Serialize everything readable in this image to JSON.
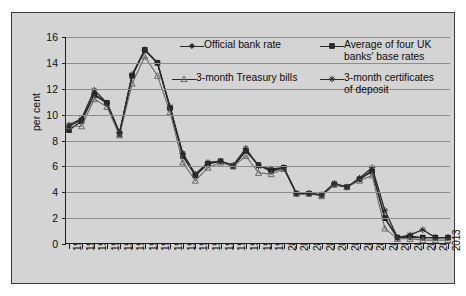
{
  "chart_data": {
    "type": "line",
    "title": "",
    "xlabel": "",
    "ylabel": "per cent",
    "ylim": [
      0,
      16
    ],
    "yticks": [
      0,
      2,
      4,
      6,
      8,
      10,
      12,
      14,
      16
    ],
    "grid": true,
    "legend_position": "top-right-inside",
    "categories": [
      "1983",
      "1984",
      "1985",
      "1986",
      "1987",
      "1988",
      "1989",
      "1990",
      "1991",
      "1992",
      "1993",
      "1994",
      "1995",
      "1996",
      "1997",
      "1998",
      "1999",
      "2000",
      "2001",
      "2002",
      "2003",
      "2004",
      "2005",
      "2006",
      "2007",
      "2008",
      "2009",
      "2010",
      "2011",
      "2012",
      "2013"
    ],
    "series": [
      {
        "name": "Official bank rate",
        "marker": "diamond",
        "color": "#2b2b2b",
        "values": [
          9.1,
          9.6,
          11.6,
          10.9,
          8.6,
          13.0,
          15.0,
          14.0,
          10.5,
          7.0,
          5.3,
          6.2,
          6.4,
          6.0,
          7.2,
          6.1,
          5.6,
          5.9,
          3.9,
          3.9,
          3.8,
          4.6,
          4.4,
          5.0,
          5.7,
          2.0,
          0.5,
          0.5,
          0.5,
          0.5,
          0.5
        ]
      },
      {
        "name": "Average of four UK banks' base rates",
        "marker": "square",
        "color": "#2b2b2b",
        "values": [
          8.8,
          9.5,
          11.5,
          10.9,
          8.5,
          13.0,
          15.0,
          14.0,
          10.5,
          6.8,
          5.3,
          6.2,
          6.4,
          6.0,
          7.2,
          6.1,
          5.7,
          5.9,
          3.9,
          3.9,
          3.8,
          4.6,
          4.4,
          5.0,
          5.6,
          2.0,
          0.5,
          0.6,
          0.5,
          0.5,
          0.5
        ]
      },
      {
        "name": "3-month Treasury bills",
        "marker": "triangle",
        "color": "#6a6a6a",
        "values": [
          9.1,
          9.1,
          11.2,
          10.6,
          8.4,
          12.4,
          14.5,
          13.0,
          10.2,
          6.3,
          4.9,
          5.9,
          6.3,
          6.0,
          6.8,
          5.5,
          5.4,
          5.8,
          3.9,
          3.9,
          3.7,
          4.6,
          4.4,
          4.9,
          5.3,
          1.2,
          0.4,
          0.4,
          0.3,
          0.3,
          0.3
        ]
      },
      {
        "name": "3-month certificates of deposit",
        "marker": "star",
        "color": "#2b2b2b",
        "values": [
          9.2,
          9.7,
          11.9,
          10.9,
          8.6,
          13.1,
          15.0,
          14.0,
          10.6,
          7.0,
          5.4,
          6.3,
          6.4,
          6.1,
          7.4,
          6.0,
          5.8,
          5.9,
          3.9,
          3.9,
          3.8,
          4.7,
          4.4,
          5.1,
          5.9,
          2.6,
          0.5,
          0.7,
          1.1,
          0.5,
          0.5
        ]
      }
    ]
  },
  "axis": {
    "ylabel": "per cent",
    "yticks": [
      "0",
      "2",
      "4",
      "6",
      "8",
      "10",
      "12",
      "14",
      "16"
    ],
    "xticks": [
      "1983",
      "1984",
      "1985",
      "1986",
      "1987",
      "1988",
      "1989",
      "1990",
      "1991",
      "1992",
      "1993",
      "1994",
      "1995",
      "1996",
      "1997",
      "1998",
      "1999",
      "2000",
      "2001",
      "2002",
      "2003",
      "2004",
      "2005",
      "2006",
      "2007",
      "2008",
      "2009",
      "2010",
      "2011",
      "2012",
      "2013"
    ]
  },
  "legend": {
    "entries": [
      {
        "label": "Official bank rate",
        "marker": "diamond"
      },
      {
        "label": "Average of four UK\nbanks' base rates",
        "marker": "square"
      },
      {
        "label": "3-month Treasury bills",
        "marker": "triangle"
      },
      {
        "label": "3-month certificates\nof deposit",
        "marker": "star"
      }
    ]
  },
  "colors": {
    "panel_background": "#d4d4d4",
    "axis": "#1e1e1e",
    "gridline": "#8d8d8d",
    "series_dark": "#2b2b2b",
    "series_grey": "#6a6a6a"
  }
}
